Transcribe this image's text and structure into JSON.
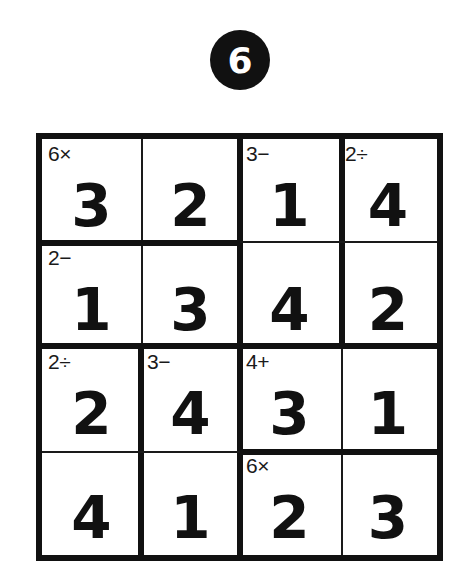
{
  "puzzle": {
    "number": "6",
    "size": 4,
    "grid": [
      [
        "3",
        "2",
        "1",
        "4"
      ],
      [
        "1",
        "3",
        "4",
        "2"
      ],
      [
        "2",
        "4",
        "3",
        "1"
      ],
      [
        "4",
        "1",
        "2",
        "3"
      ]
    ],
    "cages": [
      {
        "clue": "6×",
        "cells": [
          [
            0,
            0
          ],
          [
            0,
            1
          ]
        ]
      },
      {
        "clue": "3−",
        "cells": [
          [
            0,
            2
          ],
          [
            1,
            2
          ]
        ]
      },
      {
        "clue": "2÷",
        "cells": [
          [
            0,
            3
          ],
          [
            1,
            3
          ]
        ]
      },
      {
        "clue": "2−",
        "cells": [
          [
            1,
            0
          ],
          [
            1,
            1
          ]
        ]
      },
      {
        "clue": "2÷",
        "cells": [
          [
            2,
            0
          ],
          [
            3,
            0
          ]
        ]
      },
      {
        "clue": "3−",
        "cells": [
          [
            2,
            1
          ],
          [
            3,
            1
          ]
        ]
      },
      {
        "clue": "4+",
        "cells": [
          [
            2,
            2
          ],
          [
            2,
            3
          ]
        ]
      },
      {
        "clue": "6×",
        "cells": [
          [
            3,
            2
          ],
          [
            3,
            3
          ]
        ]
      }
    ],
    "clues_by_cell": {
      "r0c0": "6×",
      "r0c2": "3−",
      "r0c3": "2÷",
      "r1c0": "2−",
      "r2c0": "2÷",
      "r2c1": "3−",
      "r2c2": "4+",
      "r3c2": "6×"
    }
  },
  "colors": {
    "ink": "#111111",
    "background": "#ffffff",
    "badge_text": "#ffffff"
  }
}
